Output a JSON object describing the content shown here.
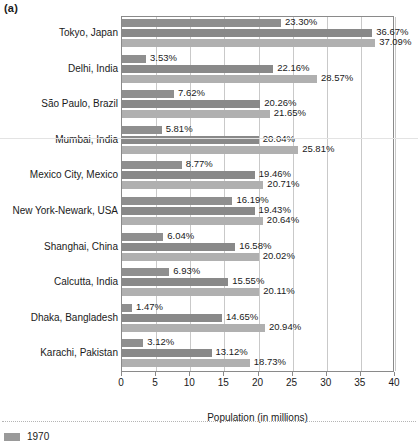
{
  "panel_label": "(a)",
  "legend": {
    "entries": [
      {
        "label": "1970",
        "color": "#9a9a9a"
      }
    ]
  },
  "chart_data": {
    "type": "bar",
    "orientation": "horizontal",
    "title": "",
    "xlabel": "Population (in millions)",
    "ylabel": "",
    "xlim": [
      0,
      40
    ],
    "xticks": [
      0,
      5,
      10,
      15,
      20,
      25,
      30,
      35,
      40
    ],
    "xtick_labels": [
      "0",
      "5",
      "10",
      "15",
      "20",
      "25",
      "30",
      "35",
      "40"
    ],
    "grid": "vertical",
    "legend_position": "below-figure",
    "value_label_format": "percent-suffix",
    "categories": [
      "Tokyo, Japan",
      "Delhi, India",
      "São Paulo, Brazil",
      "Mumbai, India",
      "Mexico City, Mexico",
      "New York-Newark, USA",
      "Shanghai, China",
      "Calcutta, India",
      "Dhaka, Bangladesh",
      "Karachi, Pakistan"
    ],
    "series": [
      {
        "name": "1970",
        "color": "#8f8f8f",
        "values": [
          23.3,
          3.53,
          7.62,
          5.81,
          8.77,
          16.19,
          6.04,
          6.93,
          1.47,
          3.12
        ],
        "labels": [
          "23.30%",
          "3.53%",
          "7.62%",
          "5.81%",
          "8.77%",
          "16.19%",
          "6.04%",
          "6.93%",
          "1.47%",
          "3.12%"
        ]
      },
      {
        "name": "series-2",
        "color": "#898989",
        "values": [
          36.67,
          22.16,
          20.26,
          20.04,
          19.46,
          19.43,
          16.58,
          15.55,
          14.65,
          13.12
        ],
        "labels": [
          "36.67%",
          "22.16%",
          "20.26%",
          "20.04%",
          "19.46%",
          "19.43%",
          "16.58%",
          "15.55%",
          "14.65%",
          "13.12%"
        ]
      },
      {
        "name": "series-3",
        "color": "#b0b0b0",
        "values": [
          37.09,
          28.57,
          21.65,
          25.81,
          20.71,
          20.64,
          20.02,
          20.11,
          20.94,
          18.73
        ],
        "labels": [
          "37.09%",
          "28.57%",
          "21.65%",
          "25.81%",
          "20.71%",
          "20.64%",
          "20.02%",
          "20.11%",
          "20.94%",
          "18.73%"
        ]
      }
    ]
  }
}
